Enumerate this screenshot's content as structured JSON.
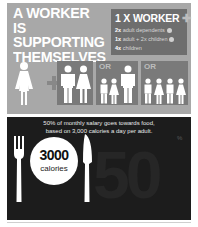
{
  "headline": {
    "line1": "A WORKER IS",
    "line2": "SUPPORTING",
    "line3": "THEMSELVES"
  },
  "legend": {
    "title": "1 X WORKER",
    "title_icon": "plus-icon",
    "rows": [
      {
        "count": "2x",
        "text": "adult dependents"
      },
      {
        "count": "1x",
        "text": "adult + 2x children"
      },
      {
        "count": "4x",
        "text": "children"
      }
    ]
  },
  "figures": {
    "option_label": "OR",
    "groups": [
      "worker",
      "2 adults",
      "1 adult + 2 children",
      "4 children"
    ]
  },
  "food": {
    "note_line1": "50% of monthly salary goes towards food,",
    "note_line2": "based on 3,000 calories a day per adult.",
    "calories_value": "3000",
    "calories_label": "calories",
    "percent_value": "50",
    "percent_sign": "%"
  },
  "colors": {
    "top_panel": "#a8a8a8",
    "legend_box": "#6e6e6e",
    "bottom_panel": "#1c1c1c",
    "figure": "#ffffff"
  }
}
